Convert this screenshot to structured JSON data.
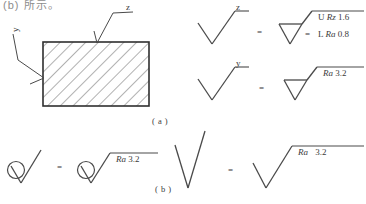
{
  "figure": {
    "title_fragment": "(b) 所示。",
    "part_labels": {
      "a": "( a )",
      "b": "( b )"
    },
    "equals_sign": "=",
    "workpiece": {
      "leader_labels": {
        "top": "z",
        "left": "y"
      },
      "hatch_angle_deg": 45,
      "note": "hatched rectangular cross-section"
    },
    "rows": [
      {
        "id": "row-z",
        "left_symbol": "basic-check-symbol",
        "left_label": "z",
        "right_symbol": "material-removal-triangle-symbol",
        "right_values": [
          "U  Rz 1.6",
          "L  Ra 0.8"
        ],
        "right_values_parts": [
          {
            "prefix": "U",
            "param": "Rz",
            "value": "1.6"
          },
          {
            "prefix": "L",
            "param": "Ra",
            "value": "0.8"
          }
        ]
      },
      {
        "id": "row-y",
        "left_symbol": "basic-check-symbol",
        "left_label": "y",
        "right_symbol": "material-removal-triangle-symbol",
        "right_values": [
          "Ra 3.2"
        ],
        "right_values_parts": [
          {
            "prefix": "",
            "param": "Ra",
            "value": "3.2"
          }
        ]
      },
      {
        "id": "row-circle",
        "left_symbol": "no-material-removal-circle-symbol",
        "left_label": "",
        "right_symbol": "no-material-removal-circle-symbol",
        "right_values": [
          "Ra 3.2"
        ],
        "right_values_parts": [
          {
            "prefix": "",
            "param": "Ra",
            "value": "3.2"
          }
        ]
      },
      {
        "id": "row-basic",
        "left_symbol": "basic-check-symbol",
        "left_label": "",
        "right_symbol": "basic-check-symbol",
        "right_values": [
          "Ra   3.2"
        ],
        "right_values_parts": [
          {
            "prefix": "",
            "param": "Ra",
            "value": "3.2"
          }
        ]
      }
    ],
    "colors": {
      "ink": "#3a3a3a",
      "hatch": "#6f6f6f",
      "background": "#ffffff"
    }
  }
}
